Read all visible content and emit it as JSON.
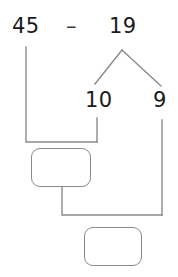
{
  "worksheet": {
    "type": "subtraction-decomposition-diagram",
    "expression": {
      "minuend": "45",
      "operator": "–",
      "subtrahend": "19"
    },
    "decomposition": {
      "parent": "19",
      "parts": [
        "10",
        "9"
      ]
    },
    "answer_boxes": [
      {
        "name": "first-step-answer",
        "value": ""
      },
      {
        "name": "final-answer",
        "value": ""
      }
    ],
    "colors": {
      "ink": "#1a1a1a",
      "line": "#8a8a8a",
      "box_border": "#8a8a8a",
      "background": "#ffffff"
    }
  }
}
